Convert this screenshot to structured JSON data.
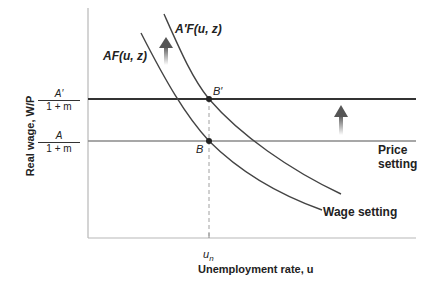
{
  "diagram": {
    "y_axis_label": "Real wage, W/P",
    "x_axis_label": "Unemployment rate, u",
    "x_tick_label": "u",
    "x_tick_subscript": "n",
    "y_ticks": [
      {
        "numerator": "A′",
        "denominator": "1 + m"
      },
      {
        "numerator": "A",
        "denominator": "1 + m"
      }
    ],
    "curves": {
      "wage_setting_old": "AF(u, z)",
      "wage_setting_new": "A′F(u, z)",
      "wage_setting_label": "Wage setting",
      "price_setting_label_line1": "Price",
      "price_setting_label_line2": "setting"
    },
    "points": {
      "old_equilibrium": "B",
      "new_equilibrium": "B′"
    },
    "colors": {
      "axis": "#b0b0b0",
      "new_price_line": "#333333",
      "old_price_line": "#8a8a8a",
      "curve": "#444444",
      "arrow": "#666666",
      "dashed": "#999999"
    }
  }
}
